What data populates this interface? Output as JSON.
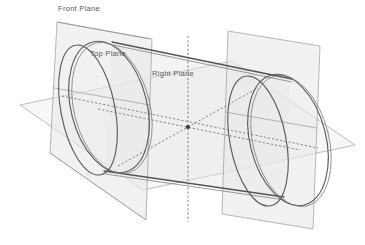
{
  "drawing": {
    "title": "Cylinder with reference planes",
    "background_color": "#ffffff",
    "plane_fill_color": "#e9e9e9",
    "plane_edge_color": "#9a9a9a",
    "model_edge_color": "#5d5d5d",
    "axis_color": "#6f6f6f",
    "label_color": "#58585a"
  },
  "labels": {
    "front_plane": "Front Plane",
    "top_plane": "Top Plane",
    "right_plane": "Right Plane"
  },
  "geometry": {
    "view": "isometric",
    "solid": "cylinder",
    "origin": {
      "x": 188,
      "y": 127
    },
    "planes": [
      {
        "name": "front-plane",
        "orientation": "vertical-left"
      },
      {
        "name": "top-plane",
        "orientation": "horizontal"
      },
      {
        "name": "right-plane",
        "orientation": "vertical-right"
      }
    ]
  }
}
